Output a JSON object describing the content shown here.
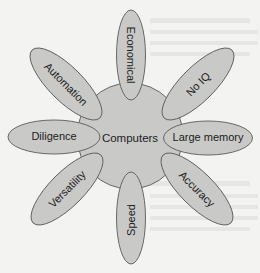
{
  "diagram": {
    "type": "hub-and-spoke",
    "colors": {
      "background": "#f3f3f1",
      "node_fill": "#c9c9c7",
      "node_stroke": "#5a5a5a",
      "text": "#1c1c1c"
    },
    "center": {
      "label": "Computers"
    },
    "petals": [
      {
        "id": "economical",
        "label": "Economical",
        "position": "top"
      },
      {
        "id": "no-iq",
        "label": "No IQ",
        "position": "top-right"
      },
      {
        "id": "large-memory",
        "label": "Large memory",
        "position": "right"
      },
      {
        "id": "accuracy",
        "label": "Accuracy",
        "position": "bottom-right"
      },
      {
        "id": "speed",
        "label": "Speed",
        "position": "bottom"
      },
      {
        "id": "versatility",
        "label": "Versatility",
        "position": "bottom-left"
      },
      {
        "id": "diligence",
        "label": "Diligence",
        "position": "left"
      },
      {
        "id": "automation",
        "label": "Automation",
        "position": "top-left"
      }
    ]
  }
}
